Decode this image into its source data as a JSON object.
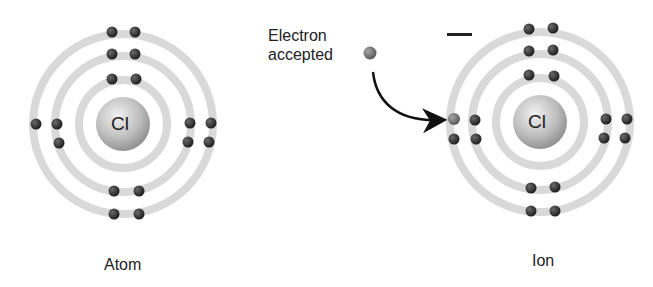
{
  "diagram": {
    "atom": {
      "label": "Atom",
      "nucleus_symbol": "Cl",
      "shells": [
        {
          "index": 1,
          "electrons": 2
        },
        {
          "index": 2,
          "electrons": 8
        },
        {
          "index": 3,
          "electrons": 7
        }
      ]
    },
    "ion": {
      "label": "Ion",
      "nucleus_symbol": "Cl",
      "charge": "−",
      "shells": [
        {
          "index": 1,
          "electrons": 2
        },
        {
          "index": 2,
          "electrons": 8
        },
        {
          "index": 3,
          "electrons": 8
        }
      ]
    },
    "transfer": {
      "label_line1": "Electron",
      "label_line2": "accepted"
    },
    "colors": {
      "shell": "#d9d9d9",
      "electron": "#2a2a2a",
      "accepted_electron": "#6e6e6e",
      "nucleus": "#bdbdbd",
      "text": "#222222"
    }
  }
}
